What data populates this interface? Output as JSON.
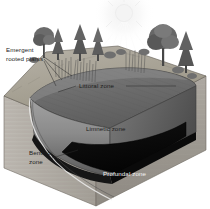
{
  "figure": {
    "background_color": "#ffffff",
    "style": "grayscale pen-and-ink scientific illustration"
  },
  "labels": {
    "emergent_rooted_plants_line1": "Emergent",
    "emergent_rooted_plants_line2": "rooted plants",
    "littoral_zone": "Littoral zone",
    "limnetic_zone": "Limnetic zone",
    "benthic_zone_line1": "Benthic",
    "benthic_zone_line2": "zone",
    "profundal_zone": "Profundal zone"
  },
  "colors": {
    "label_dark": "#1c1c1c",
    "label_light": "#f2f2f2",
    "water_surface": "#6e6e6e",
    "water_column_front": "#8d8d8d",
    "water_column_right": "#6a6a6a",
    "profundal_dark": "#0b0b0b",
    "soil_left": "#b4b0aa",
    "soil_front": "#9e9a94",
    "bank_top": "#a9a49c",
    "sun_glow": "#fbfbfb"
  },
  "scene": {
    "sun": "sun-with-rays",
    "vegetation": [
      "conifer-tree",
      "conifer-tree",
      "deciduous-tree",
      "deciduous-tree",
      "conifer-tree",
      "reeds",
      "shrubs"
    ],
    "zones": [
      "littoral",
      "limnetic",
      "profundal",
      "benthic"
    ]
  }
}
